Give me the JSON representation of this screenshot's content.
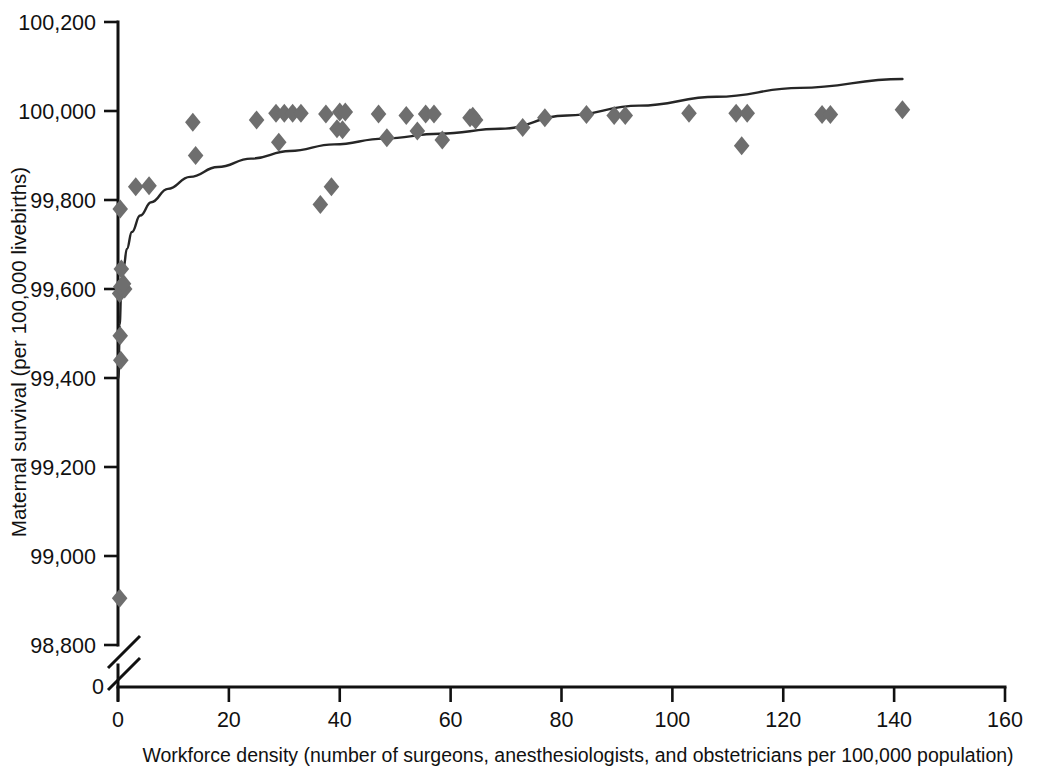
{
  "chart_data": {
    "type": "scatter",
    "title": "",
    "subtitle": "",
    "xlabel": "Workforce density (number of surgeons, anesthesiologists, and obstetricians per 100,000 population)",
    "ylabel": "Maternal survival (per 100,000 livebirths)",
    "xlim": [
      0,
      160
    ],
    "ylim": [
      98800,
      100200
    ],
    "y_axis_break": true,
    "y_axis_break_label": "0",
    "grid": false,
    "legend": null,
    "marker_shape": "diamond",
    "marker_color": "#6e6e6e",
    "curve_color": "#262626",
    "axis_color": "#111111",
    "background_color": "#ffffff",
    "xticks": [
      0,
      20,
      40,
      60,
      80,
      100,
      120,
      140,
      160
    ],
    "xticklabels": [
      "0",
      "20",
      "40",
      "60",
      "80",
      "100",
      "120",
      "140",
      "160"
    ],
    "yticks": [
      98800,
      99000,
      99200,
      99400,
      99600,
      99800,
      100000,
      100200
    ],
    "yticklabels": [
      "98,800",
      "99,000",
      "99,200",
      "99,400",
      "99,600",
      "99,800",
      "100,000",
      "100,200"
    ],
    "points": [
      {
        "x": 0.3,
        "y": 98905
      },
      {
        "x": 0.5,
        "y": 99440
      },
      {
        "x": 0.4,
        "y": 99495
      },
      {
        "x": 0.3,
        "y": 99590
      },
      {
        "x": 0.8,
        "y": 99600
      },
      {
        "x": 1.2,
        "y": 99600
      },
      {
        "x": 0.5,
        "y": 99605
      },
      {
        "x": 1.0,
        "y": 99612
      },
      {
        "x": 0.6,
        "y": 99645
      },
      {
        "x": 0.4,
        "y": 99780
      },
      {
        "x": 3.2,
        "y": 99830
      },
      {
        "x": 5.6,
        "y": 99832
      },
      {
        "x": 13.5,
        "y": 99975
      },
      {
        "x": 14.0,
        "y": 99900
      },
      {
        "x": 25.0,
        "y": 99980
      },
      {
        "x": 28.5,
        "y": 99995
      },
      {
        "x": 30.0,
        "y": 99995
      },
      {
        "x": 29.0,
        "y": 99930
      },
      {
        "x": 31.5,
        "y": 99995
      },
      {
        "x": 33.0,
        "y": 99995
      },
      {
        "x": 36.5,
        "y": 99790
      },
      {
        "x": 38.5,
        "y": 99830
      },
      {
        "x": 37.5,
        "y": 99993
      },
      {
        "x": 39.5,
        "y": 99960
      },
      {
        "x": 40.0,
        "y": 99998
      },
      {
        "x": 41.0,
        "y": 99998
      },
      {
        "x": 40.5,
        "y": 99958
      },
      {
        "x": 47.0,
        "y": 99993
      },
      {
        "x": 48.5,
        "y": 99940
      },
      {
        "x": 52.0,
        "y": 99990
      },
      {
        "x": 55.5,
        "y": 99993
      },
      {
        "x": 54.0,
        "y": 99955
      },
      {
        "x": 57.0,
        "y": 99993
      },
      {
        "x": 58.5,
        "y": 99935
      },
      {
        "x": 63.5,
        "y": 99985
      },
      {
        "x": 64.0,
        "y": 99988
      },
      {
        "x": 64.5,
        "y": 99980
      },
      {
        "x": 73.0,
        "y": 99963
      },
      {
        "x": 77.0,
        "y": 99985
      },
      {
        "x": 84.5,
        "y": 99992
      },
      {
        "x": 89.5,
        "y": 99990
      },
      {
        "x": 91.5,
        "y": 99990
      },
      {
        "x": 103.0,
        "y": 99995
      },
      {
        "x": 111.5,
        "y": 99995
      },
      {
        "x": 113.5,
        "y": 99995
      },
      {
        "x": 112.5,
        "y": 99922
      },
      {
        "x": 127.0,
        "y": 99992
      },
      {
        "x": 128.5,
        "y": 99992
      },
      {
        "x": 141.5,
        "y": 100003
      }
    ],
    "trend_curve": {
      "description": "logarithmic fit rising steeply from ~99,400 near x=0 and flattening toward ~100,070 at x=141",
      "x_start": 0.1,
      "x_end": 141.5,
      "points": [
        {
          "x": 0.1,
          "y": 99400
        },
        {
          "x": 0.3,
          "y": 99520
        },
        {
          "x": 0.6,
          "y": 99600
        },
        {
          "x": 1.0,
          "y": 99648
        },
        {
          "x": 1.6,
          "y": 99690
        },
        {
          "x": 2.5,
          "y": 99728
        },
        {
          "x": 4.0,
          "y": 99765
        },
        {
          "x": 6.0,
          "y": 99795
        },
        {
          "x": 9.0,
          "y": 99825
        },
        {
          "x": 13.0,
          "y": 99852
        },
        {
          "x": 18.0,
          "y": 99874
        },
        {
          "x": 24.0,
          "y": 99893
        },
        {
          "x": 31.0,
          "y": 99910
        },
        {
          "x": 39.0,
          "y": 99925
        },
        {
          "x": 48.0,
          "y": 99938
        },
        {
          "x": 58.0,
          "y": 99949
        },
        {
          "x": 69.0,
          "y": 99960
        },
        {
          "x": 81.0,
          "y": 99990
        },
        {
          "x": 94.0,
          "y": 100012
        },
        {
          "x": 108.0,
          "y": 100032
        },
        {
          "x": 123.0,
          "y": 100052
        },
        {
          "x": 141.5,
          "y": 100072
        }
      ]
    }
  }
}
